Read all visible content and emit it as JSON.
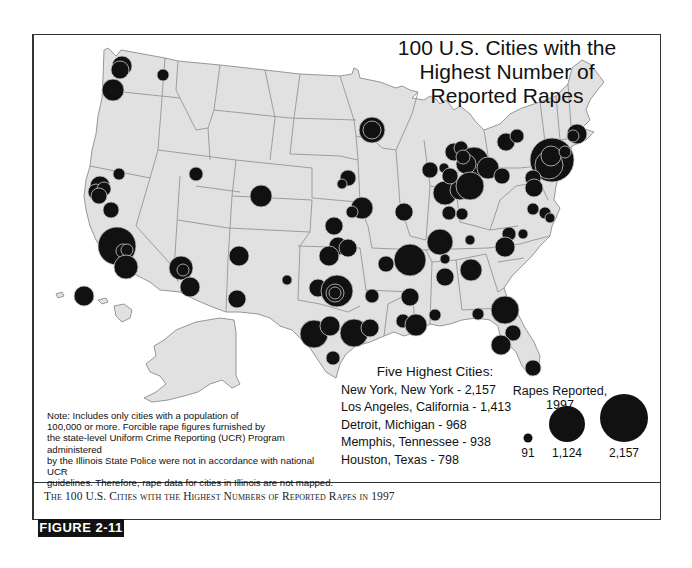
{
  "map": {
    "title_lines": [
      "100 U.S. Cities with the",
      "Highest Number of",
      "Reported Rapes"
    ],
    "land_color": "#e1e1e1",
    "border_color": "#8c8c8c",
    "circle_color": "#111111",
    "circle_outline_color": "#c8c8c8"
  },
  "five_highest": {
    "heading": "Five Highest Cities:",
    "items": [
      {
        "label": "New York, New York - 2,157",
        "city": "New York, New York",
        "value": 2157
      },
      {
        "label": "Los Angeles, California - 1,413",
        "city": "Los Angeles, California",
        "value": 1413
      },
      {
        "label": "Detroit, Michigan - 968",
        "city": "Detroit, Michigan",
        "value": 968
      },
      {
        "label": "Memphis, Tennessee - 938",
        "city": "Memphis, Tennessee",
        "value": 938
      },
      {
        "label": "Houston, Texas - 798",
        "city": "Houston, Texas",
        "value": 798
      }
    ]
  },
  "legend": {
    "title_line1": "Rapes Reported,",
    "title_line2": "1997",
    "items": [
      {
        "value": 91,
        "label": "91"
      },
      {
        "value": 1124,
        "label": "1,124"
      },
      {
        "value": 2157,
        "label": "2,157"
      }
    ]
  },
  "note": {
    "lines": [
      "Note:  Includes only cities with a population of",
      "100,000 or more.  Forcible rape figures furnished by",
      "the state-level Uniform Crime Reporting (UCR) Program administered",
      "by the Illinois State Police were not in accordance with national UCR",
      "guidelines.  Therefore, rape data for cities in Illinois are not mapped."
    ]
  },
  "caption": {
    "text": "The 100 U.S. Cities with the Highest Numbers of Reported Rapes in 1997"
  },
  "figure_tag": {
    "label": "FIGURE 2-11"
  },
  "chart_data": {
    "type": "proportional-symbol-map",
    "title": "100 U.S. Cities with the Highest Number of Reported Rapes",
    "legend_title": "Rapes Reported, 1997",
    "legend_values": [
      91,
      1124,
      2157
    ],
    "top_cities": [
      {
        "city": "New York, New York",
        "value": 2157
      },
      {
        "city": "Los Angeles, California",
        "value": 1413
      },
      {
        "city": "Detroit, Michigan",
        "value": 968
      },
      {
        "city": "Memphis, Tennessee",
        "value": 938
      },
      {
        "city": "Houston, Texas",
        "value": 798
      }
    ],
    "symbols": [
      {
        "x": 122,
        "y": 66,
        "r": 10
      },
      {
        "x": 120,
        "y": 70,
        "r": 9
      },
      {
        "x": 163,
        "y": 75,
        "r": 6
      },
      {
        "x": 113,
        "y": 90,
        "r": 11
      },
      {
        "x": 100,
        "y": 186,
        "r": 10
      },
      {
        "x": 96,
        "y": 192,
        "r": 8
      },
      {
        "x": 104,
        "y": 189,
        "r": 7
      },
      {
        "x": 99,
        "y": 196,
        "r": 8
      },
      {
        "x": 119,
        "y": 174,
        "r": 6
      },
      {
        "x": 111,
        "y": 210,
        "r": 8
      },
      {
        "x": 117,
        "y": 246,
        "r": 19
      },
      {
        "x": 123,
        "y": 251,
        "r": 7
      },
      {
        "x": 127,
        "y": 250,
        "r": 6
      },
      {
        "x": 126,
        "y": 267,
        "r": 12
      },
      {
        "x": 196,
        "y": 174,
        "r": 7
      },
      {
        "x": 261,
        "y": 196,
        "r": 11
      },
      {
        "x": 181,
        "y": 268,
        "r": 12
      },
      {
        "x": 183,
        "y": 270,
        "r": 6
      },
      {
        "x": 190,
        "y": 287,
        "r": 10
      },
      {
        "x": 239,
        "y": 256,
        "r": 10
      },
      {
        "x": 237,
        "y": 299,
        "r": 9
      },
      {
        "x": 287,
        "y": 280,
        "r": 5
      },
      {
        "x": 84,
        "y": 296,
        "r": 10
      },
      {
        "x": 372,
        "y": 130,
        "r": 13
      },
      {
        "x": 372,
        "y": 130,
        "r": 9
      },
      {
        "x": 348,
        "y": 178,
        "r": 8
      },
      {
        "x": 342,
        "y": 184,
        "r": 5
      },
      {
        "x": 362,
        "y": 208,
        "r": 11
      },
      {
        "x": 352,
        "y": 212,
        "r": 6
      },
      {
        "x": 334,
        "y": 226,
        "r": 9
      },
      {
        "x": 338,
        "y": 246,
        "r": 9
      },
      {
        "x": 348,
        "y": 248,
        "r": 9
      },
      {
        "x": 329,
        "y": 256,
        "r": 10
      },
      {
        "x": 318,
        "y": 288,
        "r": 9
      },
      {
        "x": 337,
        "y": 291,
        "r": 16
      },
      {
        "x": 335,
        "y": 293,
        "r": 9
      },
      {
        "x": 335,
        "y": 293,
        "r": 6
      },
      {
        "x": 372,
        "y": 296,
        "r": 7
      },
      {
        "x": 314,
        "y": 334,
        "r": 14
      },
      {
        "x": 330,
        "y": 326,
        "r": 10
      },
      {
        "x": 354,
        "y": 333,
        "r": 14
      },
      {
        "x": 370,
        "y": 328,
        "r": 9
      },
      {
        "x": 333,
        "y": 358,
        "r": 7
      },
      {
        "x": 404,
        "y": 212,
        "r": 9
      },
      {
        "x": 386,
        "y": 264,
        "r": 8
      },
      {
        "x": 410,
        "y": 260,
        "r": 16
      },
      {
        "x": 410,
        "y": 297,
        "r": 9
      },
      {
        "x": 403,
        "y": 321,
        "r": 7
      },
      {
        "x": 416,
        "y": 325,
        "r": 11
      },
      {
        "x": 435,
        "y": 315,
        "r": 6
      },
      {
        "x": 440,
        "y": 242,
        "r": 13
      },
      {
        "x": 445,
        "y": 259,
        "r": 5
      },
      {
        "x": 445,
        "y": 277,
        "r": 9
      },
      {
        "x": 470,
        "y": 240,
        "r": 5
      },
      {
        "x": 471,
        "y": 270,
        "r": 11
      },
      {
        "x": 478,
        "y": 314,
        "r": 6
      },
      {
        "x": 430,
        "y": 170,
        "r": 8
      },
      {
        "x": 444,
        "y": 168,
        "r": 5
      },
      {
        "x": 454,
        "y": 152,
        "r": 9
      },
      {
        "x": 461,
        "y": 148,
        "r": 7
      },
      {
        "x": 474,
        "y": 162,
        "r": 15
      },
      {
        "x": 466,
        "y": 164,
        "r": 10
      },
      {
        "x": 463,
        "y": 157,
        "r": 7
      },
      {
        "x": 488,
        "y": 168,
        "r": 11
      },
      {
        "x": 445,
        "y": 193,
        "r": 12
      },
      {
        "x": 460,
        "y": 190,
        "r": 10
      },
      {
        "x": 470,
        "y": 186,
        "r": 14
      },
      {
        "x": 450,
        "y": 176,
        "r": 8
      },
      {
        "x": 449,
        "y": 213,
        "r": 7
      },
      {
        "x": 462,
        "y": 214,
        "r": 6
      },
      {
        "x": 502,
        "y": 176,
        "r": 8
      },
      {
        "x": 506,
        "y": 142,
        "r": 9
      },
      {
        "x": 517,
        "y": 136,
        "r": 7
      },
      {
        "x": 552,
        "y": 160,
        "r": 22
      },
      {
        "x": 549,
        "y": 165,
        "r": 14
      },
      {
        "x": 551,
        "y": 156,
        "r": 10
      },
      {
        "x": 565,
        "y": 152,
        "r": 6
      },
      {
        "x": 577,
        "y": 134,
        "r": 10
      },
      {
        "x": 573,
        "y": 136,
        "r": 6
      },
      {
        "x": 533,
        "y": 178,
        "r": 8
      },
      {
        "x": 534,
        "y": 188,
        "r": 9
      },
      {
        "x": 533,
        "y": 209,
        "r": 6
      },
      {
        "x": 545,
        "y": 213,
        "r": 6
      },
      {
        "x": 550,
        "y": 218,
        "r": 5
      },
      {
        "x": 509,
        "y": 234,
        "r": 7
      },
      {
        "x": 523,
        "y": 234,
        "r": 5
      },
      {
        "x": 505,
        "y": 247,
        "r": 10
      },
      {
        "x": 505,
        "y": 310,
        "r": 14
      },
      {
        "x": 513,
        "y": 333,
        "r": 8
      },
      {
        "x": 501,
        "y": 345,
        "r": 10
      },
      {
        "x": 533,
        "y": 368,
        "r": 8
      }
    ]
  }
}
